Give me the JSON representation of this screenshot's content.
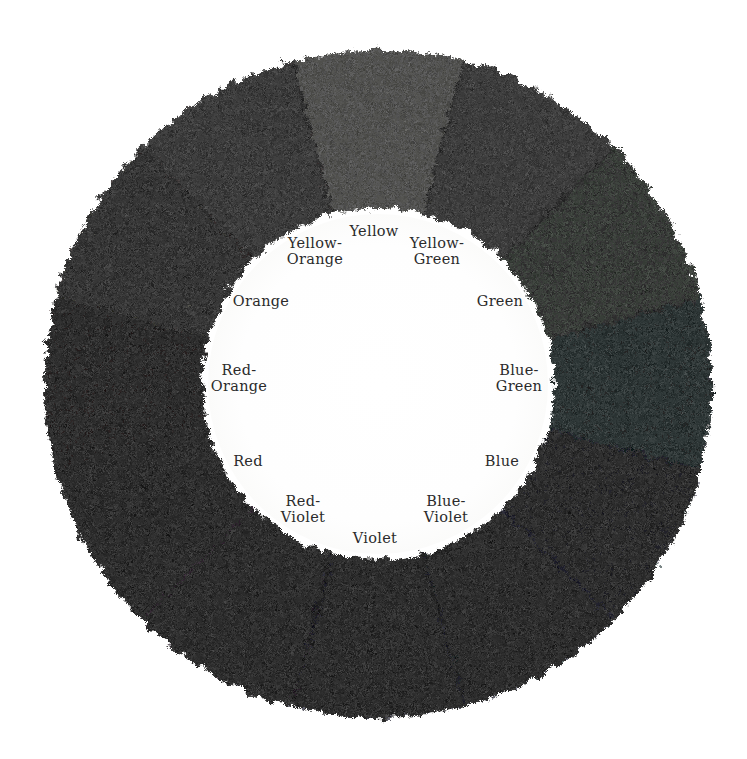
{
  "figure": {
    "name": "color-wheel",
    "background_color": "#ffffff",
    "paper_tint": "#fdfdfc",
    "hub_color": "#fefefe",
    "label_color": "#2b2b2b",
    "center": {
      "x": 378,
      "y": 384
    },
    "outer_radius": 334,
    "inner_radius": 175,
    "label_radius": 150,
    "segment_count": 12
  },
  "chart_data": {
    "type": "pie",
    "title": "",
    "xlabel": "",
    "ylabel": "",
    "legend_position": "inner-hub",
    "grid": false,
    "categories": [
      "Yellow",
      "Yellow-Green",
      "Green",
      "Blue-Green",
      "Blue",
      "Blue-Violet",
      "Violet",
      "Red-Violet",
      "Red",
      "Red-Orange",
      "Orange",
      "Yellow-Orange"
    ],
    "values": [
      30,
      30,
      30,
      30,
      30,
      30,
      30,
      30,
      30,
      30,
      30,
      30
    ],
    "colors": [
      "#3a3a38",
      "#232323",
      "#1d1f1d",
      "#141617",
      "#0e1014",
      "#0b0c12",
      "#0a0a0d",
      "#0d0c0e",
      "#111011",
      "#141313",
      "#181716",
      "#212020"
    ]
  },
  "segments": [
    {
      "name": "yellow",
      "label": "Yellow",
      "label_lines": "Yellow",
      "color": "#3a3a38",
      "start_angle": -15,
      "end_angle": 15,
      "label_angle": 0,
      "label_x": 374,
      "label_y": 231
    },
    {
      "name": "yellow-green",
      "label": "Yellow-Green",
      "label_lines": "Yellow-\nGreen",
      "color": "#232323",
      "start_angle": 15,
      "end_angle": 45,
      "label_angle": 30,
      "label_x": 437,
      "label_y": 251
    },
    {
      "name": "green",
      "label": "Green",
      "label_lines": "Green",
      "color": "#1d1f1d",
      "start_angle": 45,
      "end_angle": 75,
      "label_angle": 60,
      "label_x": 500,
      "label_y": 301
    },
    {
      "name": "blue-green",
      "label": "Blue-Green",
      "label_lines": "Blue-\nGreen",
      "color": "#141617",
      "start_angle": 75,
      "end_angle": 105,
      "label_angle": 90,
      "label_x": 519,
      "label_y": 378
    },
    {
      "name": "blue",
      "label": "Blue",
      "label_lines": "Blue",
      "color": "#0e1014",
      "start_angle": 105,
      "end_angle": 135,
      "label_angle": 120,
      "label_x": 502,
      "label_y": 461
    },
    {
      "name": "blue-violet",
      "label": "Blue-Violet",
      "label_lines": "Blue-\nViolet",
      "color": "#0b0c12",
      "start_angle": 135,
      "end_angle": 165,
      "label_angle": 150,
      "label_x": 446,
      "label_y": 509
    },
    {
      "name": "violet",
      "label": "Violet",
      "label_lines": "Violet",
      "color": "#0a0a0d",
      "start_angle": 165,
      "end_angle": 195,
      "label_angle": 180,
      "label_x": 375,
      "label_y": 538
    },
    {
      "name": "red-violet",
      "label": "Red-Violet",
      "label_lines": "Red-\nViolet",
      "color": "#0d0c0e",
      "start_angle": 195,
      "end_angle": 225,
      "label_angle": 210,
      "label_x": 303,
      "label_y": 509
    },
    {
      "name": "red",
      "label": "Red",
      "label_lines": "Red",
      "color": "#111011",
      "start_angle": 225,
      "end_angle": 255,
      "label_angle": 240,
      "label_x": 248,
      "label_y": 461
    },
    {
      "name": "red-orange",
      "label": "Red-Orange",
      "label_lines": "Red-\nOrange",
      "color": "#141313",
      "start_angle": 255,
      "end_angle": 285,
      "label_angle": 270,
      "label_x": 239,
      "label_y": 378
    },
    {
      "name": "orange",
      "label": "Orange",
      "label_lines": "Orange",
      "color": "#181716",
      "start_angle": 285,
      "end_angle": 315,
      "label_angle": 300,
      "label_x": 261,
      "label_y": 301
    },
    {
      "name": "yellow-orange",
      "label": "Yellow-Orange",
      "label_lines": "Yellow-\nOrange",
      "color": "#212020",
      "start_angle": 315,
      "end_angle": 345,
      "label_angle": 330,
      "label_x": 315,
      "label_y": 251
    }
  ]
}
